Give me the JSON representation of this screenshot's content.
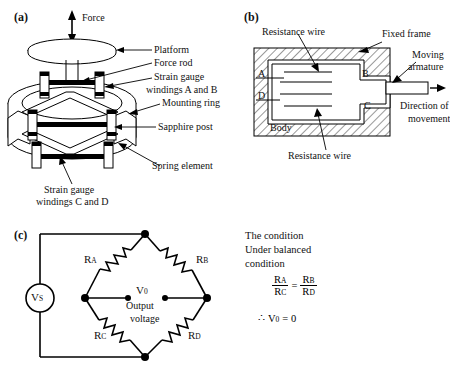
{
  "figure": {
    "background": "#ffffff",
    "line_color": "#000000"
  },
  "panel_a": {
    "tag": "(a)",
    "force_label": "Force",
    "labels": {
      "platform": "Platform",
      "force_rod": "Force rod",
      "strain_gauge": "Strain gauge",
      "windings_ab": "windings A and B",
      "mounting_ring": "Mounting ring",
      "sapphire_post": "Sapphire post",
      "spring_element": "Spring element",
      "strain_gauge_cd_line1": "Strain gauge",
      "strain_gauge_cd_line2": "windings C and D"
    }
  },
  "panel_b": {
    "tag": "(b)",
    "labels": {
      "resistance_wire_top": "Resistance wire",
      "resistance_wire_bottom": "Resistance wire",
      "fixed_frame": "Fixed frame",
      "moving_armature_line1": "Moving",
      "moving_armature_line2": "armature",
      "direction_line1": "Direction of",
      "direction_line2": "movement",
      "body": "Body",
      "node_a": "A",
      "node_b": "B",
      "node_c": "C",
      "node_d": "D"
    }
  },
  "panel_c": {
    "tag": "(c)",
    "source_label": "V",
    "source_sub": "S",
    "resistors": [
      {
        "name": "R",
        "sub": "A"
      },
      {
        "name": "R",
        "sub": "B"
      },
      {
        "name": "R",
        "sub": "C"
      },
      {
        "name": "R",
        "sub": "D"
      }
    ],
    "output": {
      "symbol": "V",
      "symbol_sub": "0",
      "caption_line1": "Output",
      "caption_line2": "voltage"
    },
    "note": {
      "line1": "The condition",
      "line2": "Under balanced",
      "line3": "condition",
      "equation": {
        "left_num": "R",
        "left_num_sub": "A",
        "left_den": "R",
        "left_den_sub": "C",
        "operator": "=",
        "right_num": "R",
        "right_num_sub": "B",
        "right_den": "R",
        "right_den_sub": "D"
      },
      "conclusion": {
        "therefore": "∴",
        "symbol": "V",
        "symbol_sub": "0",
        "equals": "= 0"
      }
    }
  }
}
